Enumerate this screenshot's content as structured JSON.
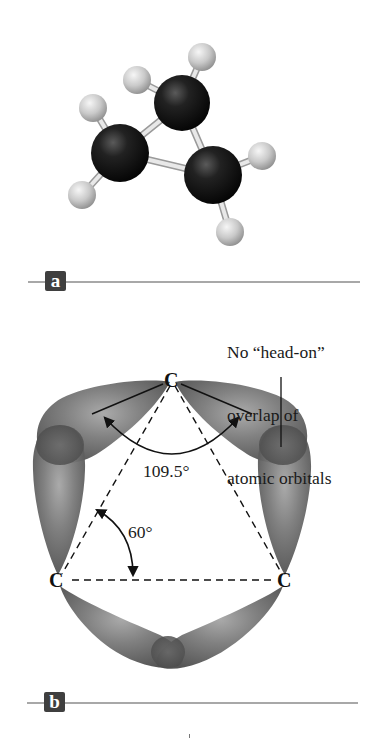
{
  "figure": {
    "panels": [
      {
        "id": "a",
        "label": "a",
        "description": "Ball-and-stick model of cyclopropane",
        "atoms": [
          {
            "element": "C",
            "role": "ring-carbon-top",
            "x": 182,
            "y": 103,
            "r": 28
          },
          {
            "element": "C",
            "role": "ring-carbon-left",
            "x": 120,
            "y": 153,
            "r": 29
          },
          {
            "element": "C",
            "role": "ring-carbon-right",
            "x": 213,
            "y": 175,
            "r": 29
          },
          {
            "element": "H",
            "role": "hydrogen",
            "x": 202,
            "y": 57,
            "r": 14
          },
          {
            "element": "H",
            "role": "hydrogen",
            "x": 137,
            "y": 80,
            "r": 14
          },
          {
            "element": "H",
            "role": "hydrogen",
            "x": 93,
            "y": 108,
            "r": 14
          },
          {
            "element": "H",
            "role": "hydrogen",
            "x": 82,
            "y": 195,
            "r": 14
          },
          {
            "element": "H",
            "role": "hydrogen",
            "x": 262,
            "y": 156,
            "r": 14
          },
          {
            "element": "H",
            "role": "hydrogen",
            "x": 230,
            "y": 232,
            "r": 14
          }
        ],
        "bonds": [
          [
            0,
            1
          ],
          [
            0,
            2
          ],
          [
            1,
            2
          ],
          [
            0,
            3
          ],
          [
            0,
            4
          ],
          [
            1,
            5
          ],
          [
            1,
            6
          ],
          [
            2,
            7
          ],
          [
            2,
            8
          ]
        ]
      },
      {
        "id": "b",
        "label": "b",
        "description": "Bent (banana) bonds from sp3 orbital overlap in cyclopropane",
        "carbons": [
          {
            "label": "C",
            "position": "top"
          },
          {
            "label": "C",
            "position": "bottom-left"
          },
          {
            "label": "C",
            "position": "bottom-right"
          }
        ],
        "angles": {
          "tetrahedral": "109.5°",
          "ring": "60°"
        },
        "callout": {
          "lines": [
            "No “head-on”",
            "overlap of",
            "atomic orbitals"
          ]
        }
      }
    ]
  },
  "colors": {
    "carbon": "#151515",
    "hydrogen": "#c8c8c8",
    "bond": "#d6d6d6",
    "orbital": "#6d6d6d",
    "orbital_overlap": "#555555",
    "rule": "#a8a8a8",
    "label_box": "#3f3f3f",
    "text": "#1a1a1a"
  }
}
